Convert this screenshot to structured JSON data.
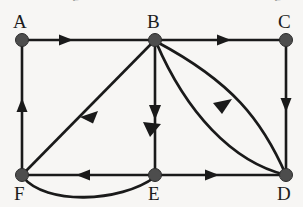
{
  "diagram": {
    "background_color": "#f7f6f4",
    "node_color": "#4d4d4d",
    "edge_color": "#1a1a1a",
    "width": 303,
    "height": 207,
    "clipped_header": {
      "fragment_left": "g",
      "fragment_right": "g"
    },
    "nodes": [
      {
        "id": "A",
        "label": "A",
        "x": 22,
        "y": 40,
        "label_x": 13,
        "label_y": 12
      },
      {
        "id": "B",
        "label": "B",
        "x": 155,
        "y": 40,
        "label_x": 147,
        "label_y": 12
      },
      {
        "id": "C",
        "label": "C",
        "x": 286,
        "y": 40,
        "label_x": 278,
        "label_y": 12
      },
      {
        "id": "F",
        "label": "F",
        "x": 22,
        "y": 175,
        "label_x": 14,
        "label_y": 184
      },
      {
        "id": "E",
        "label": "E",
        "x": 155,
        "y": 175,
        "label_x": 148,
        "label_y": 184
      },
      {
        "id": "D",
        "label": "D",
        "x": 286,
        "y": 175,
        "label_x": 277,
        "label_y": 184
      }
    ],
    "edges": [
      {
        "id": "edge-a-b",
        "from": "A",
        "to": "B",
        "shape": "straight",
        "directed": true,
        "arrow_position": "midpoint"
      },
      {
        "id": "edge-b-c",
        "from": "B",
        "to": "C",
        "shape": "straight",
        "directed": true,
        "arrow_position": "midpoint"
      },
      {
        "id": "edge-c-d",
        "from": "C",
        "to": "D",
        "shape": "straight",
        "directed": true,
        "arrow_position": "midpoint"
      },
      {
        "id": "edge-f-a",
        "from": "F",
        "to": "A",
        "shape": "straight",
        "directed": true,
        "arrow_position": "midpoint"
      },
      {
        "id": "edge-b-f",
        "from": "B",
        "to": "F",
        "shape": "straight",
        "directed": true,
        "arrow_position": "midpoint"
      },
      {
        "id": "edge-b-e",
        "from": "B",
        "to": "E",
        "shape": "straight",
        "directed": true,
        "arrow_position": "midpoint"
      },
      {
        "id": "edge-e-f",
        "from": "E",
        "to": "F",
        "shape": "straight",
        "directed": true,
        "arrow_position": "midpoint"
      },
      {
        "id": "edge-e-d",
        "from": "E",
        "to": "D",
        "shape": "straight",
        "directed": true,
        "arrow_position": "midpoint"
      },
      {
        "id": "edge-d-b-outer",
        "from": "D",
        "to": "B",
        "shape": "curved",
        "directed": true,
        "arrow_position": "midpoint"
      },
      {
        "id": "edge-d-b-inner",
        "from": "D",
        "to": "B",
        "shape": "curved",
        "directed": true,
        "arrow_position": "midpoint"
      },
      {
        "id": "edge-f-e-curve",
        "from": "F",
        "to": "E",
        "shape": "curved",
        "directed": false,
        "arrow_position": "none"
      }
    ]
  }
}
